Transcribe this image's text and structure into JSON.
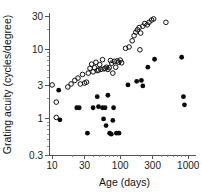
{
  "chart_data": {
    "type": "scatter",
    "title": "",
    "xlabel": "Age (days)",
    "ylabel": "Grating acuity (cycles/degree)",
    "xscale": "log",
    "yscale": "log",
    "xlim": [
      9,
      1300
    ],
    "ylim": [
      0.3,
      33
    ],
    "grid": false,
    "legend_position": "none",
    "xticks": [
      10,
      30,
      100,
      300,
      1000
    ],
    "xtick_labels": [
      "10",
      "30",
      "100",
      "300",
      "1000"
    ],
    "yticks": [
      0.3,
      1,
      3,
      10,
      30
    ],
    "ytick_labels": [
      "0.3",
      "1",
      "3",
      "10",
      "30"
    ],
    "series": [
      {
        "name": "open-circles",
        "marker": "open-circle",
        "color": "#111111",
        "points": [
          [
            10.0,
            3.1
          ],
          [
            11.5,
            1.75
          ],
          [
            11.5,
            1.05
          ],
          [
            17.0,
            2.9
          ],
          [
            19.0,
            3.2
          ],
          [
            21.5,
            3.6
          ],
          [
            24.0,
            3.9
          ],
          [
            26.0,
            3.2
          ],
          [
            28.0,
            4.4
          ],
          [
            30.0,
            3.3
          ],
          [
            32.0,
            3.4
          ],
          [
            34.0,
            4.6
          ],
          [
            36.0,
            5.4
          ],
          [
            38.0,
            6.2
          ],
          [
            40.0,
            4.8
          ],
          [
            42.0,
            5.5
          ],
          [
            44.0,
            6.6
          ],
          [
            46.0,
            5.0
          ],
          [
            48.0,
            5.1
          ],
          [
            50.0,
            6.1
          ],
          [
            52.0,
            5.2
          ],
          [
            55.0,
            7.2
          ],
          [
            58.0,
            5.3
          ],
          [
            60.0,
            5.4
          ],
          [
            63.0,
            5.6
          ],
          [
            66.0,
            5.2
          ],
          [
            69.0,
            5.5
          ],
          [
            72.0,
            7.0
          ],
          [
            75.0,
            6.4
          ],
          [
            78.0,
            4.6
          ],
          [
            82.0,
            6.8
          ],
          [
            86.0,
            5.6
          ],
          [
            90.0,
            6.9
          ],
          [
            95.0,
            6.6
          ],
          [
            100.0,
            7.1
          ],
          [
            105.0,
            6.5
          ],
          [
            120.0,
            10.5
          ],
          [
            135.0,
            11.0
          ],
          [
            150.0,
            13.5
          ],
          [
            160.0,
            16.0
          ],
          [
            170.0,
            18.0
          ],
          [
            180.0,
            19.5
          ],
          [
            190.0,
            21.0
          ],
          [
            200.0,
            17.5
          ],
          [
            215.0,
            22.0
          ],
          [
            230.0,
            24.0
          ],
          [
            250.0,
            23.0
          ],
          [
            265.0,
            25.0
          ],
          [
            290.0,
            27.0
          ],
          [
            310.0,
            28.0
          ],
          [
            470.0,
            25.0
          ],
          [
            195.0,
            10.0
          ]
        ]
      },
      {
        "name": "filled-circles",
        "marker": "filled-circle",
        "color": "#0a0a0a",
        "points": [
          [
            12.5,
            2.6
          ],
          [
            13.0,
            0.97
          ],
          [
            23.0,
            1.45
          ],
          [
            25.0,
            1.45
          ],
          [
            33.0,
            0.62
          ],
          [
            40.0,
            1.45
          ],
          [
            46.0,
            2.1
          ],
          [
            48.0,
            1.5
          ],
          [
            55.0,
            1.45
          ],
          [
            57.0,
            1.0
          ],
          [
            60.0,
            1.45
          ],
          [
            62.0,
            0.8
          ],
          [
            66.0,
            2.2
          ],
          [
            70.0,
            0.62
          ],
          [
            74.0,
            0.6
          ],
          [
            78.0,
            0.95
          ],
          [
            80.0,
            1.45
          ],
          [
            88.0,
            0.62
          ],
          [
            96.0,
            0.62
          ],
          [
            130.0,
            3.1
          ],
          [
            175.0,
            3.5
          ],
          [
            205.0,
            3.6
          ],
          [
            215.0,
            3.0
          ],
          [
            255.0,
            5.6
          ],
          [
            320.0,
            7.3
          ],
          [
            800.0,
            7.8
          ],
          [
            850.0,
            2.1
          ],
          [
            880.0,
            1.6
          ]
        ]
      }
    ]
  }
}
